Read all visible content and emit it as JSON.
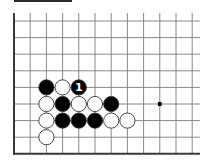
{
  "diagram": {
    "type": "go-board-fragment",
    "colors": {
      "background": "#ffffff",
      "line": "#7a7a7a",
      "edge": "#3a3a3a",
      "black_stone": "#000000",
      "white_stone": "#ffffff",
      "stone_outline": "#333333",
      "label_on_black": "#ffffff"
    },
    "grid": {
      "columns": 12,
      "rows": 8,
      "origin_x": 14,
      "origin_y": 21,
      "spacing_x": 16.2,
      "spacing_y": 16.6,
      "edges": [
        "left",
        "bottom"
      ]
    },
    "star_points": [
      {
        "col": 9,
        "row": 5
      }
    ],
    "stones": [
      {
        "col": 2,
        "row": 4,
        "color": "black",
        "label": ""
      },
      {
        "col": 3,
        "row": 4,
        "color": "white",
        "label": ""
      },
      {
        "col": 4,
        "row": 4,
        "color": "black",
        "label": "1"
      },
      {
        "col": 2,
        "row": 5,
        "color": "white",
        "label": ""
      },
      {
        "col": 3,
        "row": 5,
        "color": "black",
        "label": ""
      },
      {
        "col": 4,
        "row": 5,
        "color": "white",
        "label": ""
      },
      {
        "col": 5,
        "row": 5,
        "color": "white",
        "label": ""
      },
      {
        "col": 6,
        "row": 5,
        "color": "black",
        "label": ""
      },
      {
        "col": 2,
        "row": 6,
        "color": "white",
        "label": ""
      },
      {
        "col": 3,
        "row": 6,
        "color": "black",
        "label": ""
      },
      {
        "col": 4,
        "row": 6,
        "color": "black",
        "label": ""
      },
      {
        "col": 5,
        "row": 6,
        "color": "black",
        "label": ""
      },
      {
        "col": 6,
        "row": 6,
        "color": "white",
        "label": ""
      },
      {
        "col": 7,
        "row": 6,
        "color": "white",
        "label": ""
      },
      {
        "col": 2,
        "row": 7,
        "color": "white",
        "label": ""
      }
    ],
    "top_bar": {
      "x": 14,
      "y": 0,
      "width": 58,
      "height": 2
    }
  }
}
